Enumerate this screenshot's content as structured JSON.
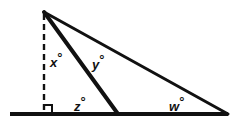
{
  "figure": {
    "kind": "geometry-diagram",
    "canvas": {
      "width": 238,
      "height": 124
    },
    "colors": {
      "ink": "#111111",
      "background": "#ffffff"
    },
    "labels": [
      {
        "id": "x",
        "variable": "x",
        "degree_symbol": "°",
        "x": 50,
        "y": 51
      },
      {
        "id": "y",
        "variable": "y",
        "degree_symbol": "°",
        "x": 92,
        "y": 53
      },
      {
        "id": "z",
        "variable": "z",
        "degree_symbol": "°",
        "x": 74,
        "y": 95
      },
      {
        "id": "w",
        "variable": "w",
        "degree_symbol": "°",
        "x": 169,
        "y": 95
      }
    ],
    "points": {
      "apex": {
        "x": 44,
        "y": 12
      },
      "foot": {
        "x": 44,
        "y": 114
      },
      "base_left": {
        "x": 10,
        "y": 114
      },
      "base_mid": {
        "x": 118,
        "y": 114
      },
      "base_right": {
        "x": 228,
        "y": 114
      }
    },
    "strokes": {
      "baseline_width": 4,
      "hypotenuse_width": 3,
      "cevian_width": 4,
      "dashed_width": 2,
      "dash_pattern": "6,4",
      "right_angle_width": 2,
      "right_angle_size": 8
    }
  },
  "chart_data": {
    "type": "diagram",
    "title": "",
    "annotations": [
      "x°",
      "y°",
      "z°",
      "w°"
    ]
  }
}
